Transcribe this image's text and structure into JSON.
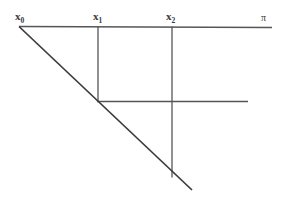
{
  "figure": {
    "width": 281,
    "height": 209,
    "background_color": "#ffffff",
    "line_color": "#55555a",
    "diagonal_color": "#3a3a3a",
    "text_color": "#3a3a3a"
  },
  "labels": {
    "x0": {
      "base": "x",
      "sub": "0",
      "x": 15,
      "y": 11
    },
    "x1": {
      "base": "x",
      "sub": "1",
      "x": 93,
      "y": 11
    },
    "x2": {
      "base": "x",
      "sub": "2",
      "x": 166,
      "y": 11
    },
    "plane": {
      "text": "π",
      "x": 261,
      "y": 13
    }
  },
  "geometry": {
    "plane_line": {
      "x1": 19,
      "y1": 26.5,
      "x2": 272,
      "y2": 27.5
    },
    "diagonal_line": {
      "x1": 19,
      "y1": 26.5,
      "x2": 192,
      "y2": 190
    },
    "vertical_x1": {
      "x1": 98,
      "y1": 26.5,
      "x2": 98,
      "y2": 101.5
    },
    "vertical_x2": {
      "x1": 172,
      "y1": 26.5,
      "x2": 172,
      "y2": 177.5
    },
    "middle_horizontal": {
      "x1": 97,
      "y1": 101.5,
      "x2": 248,
      "y2": 101.5
    }
  }
}
